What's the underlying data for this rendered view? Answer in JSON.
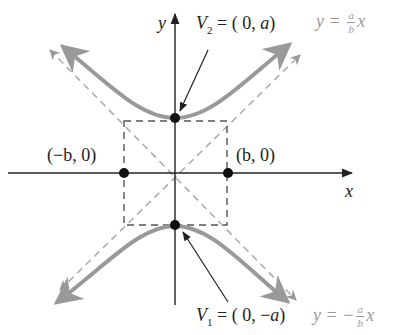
{
  "diagram": {
    "type": "hyperbola",
    "axes": {
      "x_label": "x",
      "y_label": "y"
    },
    "points": [
      {
        "name": "V2",
        "label_prefix": "V",
        "label_sub": "2",
        "label_rest": " = ( 0, ",
        "label_var": "a",
        "label_end": ")",
        "coords": [
          0,
          "a"
        ]
      },
      {
        "name": "V1",
        "label_prefix": "V",
        "label_sub": "1",
        "label_rest": " = ( 0, −",
        "label_var": "a",
        "label_end": ")",
        "coords": [
          0,
          "-a"
        ]
      },
      {
        "name": "left",
        "label": "(−b, 0)"
      },
      {
        "name": "right",
        "label": "(b, 0)"
      }
    ],
    "asymptotes": [
      {
        "eq_lhs": "y = ",
        "num": "a",
        "den": "b",
        "rhs": "x"
      },
      {
        "eq_lhs": "y = −",
        "num": "a",
        "den": "b",
        "rhs": "x"
      }
    ],
    "colors": {
      "curve": "#9a9a9a",
      "asymptote": "#aaaaaa",
      "axis": "#222222",
      "box": "#555555",
      "point": "#111111"
    }
  }
}
